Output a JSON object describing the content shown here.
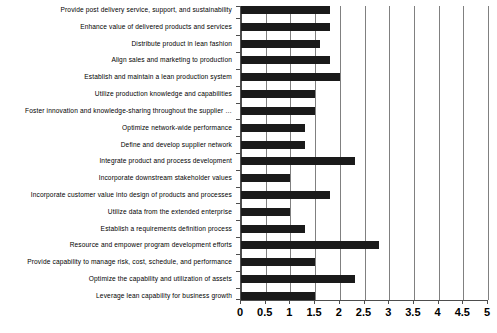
{
  "chart_data": {
    "type": "bar",
    "orientation": "horizontal",
    "title": "",
    "subtitle": "",
    "xlabel": "",
    "ylabel": "",
    "xlim": [
      0,
      5
    ],
    "xticks": [
      "0",
      "0.5",
      "1",
      "1.5",
      "2",
      "2.5",
      "3",
      "3.5",
      "4",
      "4.5",
      "5"
    ],
    "xtick_values": [
      0,
      0.5,
      1,
      1.5,
      2,
      2.5,
      3,
      3.5,
      4,
      4.5,
      5
    ],
    "grid": true,
    "grid_axis": "x",
    "legend": false,
    "legend_position": "none",
    "bar_color": "#1a1a1a",
    "axis_color": "#4d4d4d",
    "grid_color": "#808080",
    "categories": [
      "Provide post delivery service, support, and sustainability",
      "Enhance value of delivered products and services",
      "Distribute product in lean fashion",
      "Align sales and marketing to production",
      "Establish and maintain a lean production system",
      "Utilize production knowledge and capabilities",
      "Foster innovation and knowledge-sharing throughout the supplier …",
      "Optimize network-wide performance",
      "Define and develop supplier network",
      "Integrate product and process development",
      "Incorporate downstream stakeholder values",
      "Incorporate customer value into design of products and processes",
      "Utilize data from the extended enterprise",
      "Establish a requirements definition process",
      "Resource and empower program development efforts",
      "Provide capability to manage risk, cost, schedule, and performance",
      "Optimize the capability and utilization of assets",
      "Leverage lean capability for business growth"
    ],
    "values": [
      1.8,
      1.8,
      1.6,
      1.8,
      2.0,
      1.5,
      1.5,
      1.3,
      1.3,
      2.3,
      1.0,
      1.8,
      1.0,
      1.3,
      2.8,
      1.5,
      2.3,
      1.5
    ]
  }
}
